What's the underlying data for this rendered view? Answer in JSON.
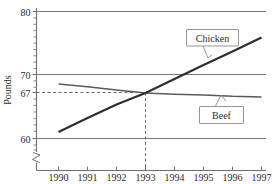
{
  "chart_data": {
    "type": "line",
    "title": "",
    "xlabel": "",
    "ylabel": "Pounds",
    "x": [
      1990,
      1991,
      1992,
      1993,
      1994,
      1995,
      1996,
      1997
    ],
    "xtick_labels": [
      "1990",
      "1991",
      "1992",
      "1993",
      "1994",
      "1995",
      "1996",
      "1997"
    ],
    "ytick_labels": [
      "80",
      "70",
      "67",
      "60"
    ],
    "ytick_values": [
      80,
      70,
      67,
      60
    ],
    "ylim": [
      58,
      81
    ],
    "xlim": [
      1989.4,
      1997.6
    ],
    "grid": "horizontal",
    "y_axis_break": true,
    "legend_position": "inline-callouts",
    "series": [
      {
        "name": "Chicken",
        "color": "#2f2f2f",
        "values": [
          61.0,
          63.2,
          65.3,
          67.1,
          69.3,
          71.5,
          73.6,
          75.8
        ]
      },
      {
        "name": "Beef",
        "color": "#5a5a5a",
        "values": [
          68.5,
          68.1,
          67.6,
          67.1,
          66.9,
          66.8,
          66.6,
          66.5
        ]
      }
    ],
    "annotations": [
      {
        "name": "intersection-guide",
        "type": "dashed-crosshair",
        "x": 1993,
        "y": 67,
        "x_label": "1993",
        "y_label": "67"
      },
      {
        "name": "chicken-callout",
        "type": "callout-box",
        "label": "Chicken"
      },
      {
        "name": "beef-callout",
        "type": "callout-box",
        "label": "Beef"
      }
    ]
  },
  "axis": {
    "y_title": "Pounds",
    "y_ticks": [
      {
        "label": "80"
      },
      {
        "label": "70"
      },
      {
        "label": "67"
      },
      {
        "label": "60"
      }
    ],
    "x_ticks": [
      {
        "label": "1990"
      },
      {
        "label": "1991"
      },
      {
        "label": "1992"
      },
      {
        "label": "1993"
      },
      {
        "label": "1994"
      },
      {
        "label": "1995"
      },
      {
        "label": "1996"
      },
      {
        "label": "1997"
      }
    ]
  },
  "callouts": {
    "chicken": "Chicken",
    "beef": "Beef"
  }
}
